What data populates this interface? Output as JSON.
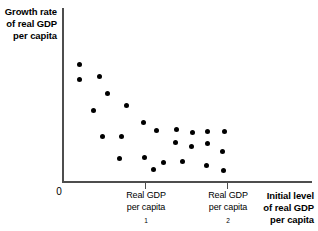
{
  "chart_data": {
    "type": "scatter",
    "title": "",
    "xlabel": "Initial level of real GDP per capita",
    "ylabel": "Growth rate of real GDP per capita",
    "grid": false,
    "legend": null,
    "xlim": [
      0,
      100
    ],
    "ylim": [
      0,
      100
    ],
    "axis_origin_label": "0",
    "xticks": [
      {
        "pos_px": 145,
        "value": 38,
        "label_line1": "Real GDP",
        "label_line2": "per capita",
        "label_sub": "1"
      },
      {
        "pos_px": 227,
        "value": 70,
        "label_line1": "Real GDP",
        "label_line2": "per capita",
        "label_sub": "2"
      }
    ],
    "points": [
      {
        "x_px": 79,
        "y_px": 64
      },
      {
        "x_px": 79,
        "y_px": 79
      },
      {
        "x_px": 99,
        "y_px": 76
      },
      {
        "x_px": 107,
        "y_px": 93
      },
      {
        "x_px": 93,
        "y_px": 110
      },
      {
        "x_px": 126,
        "y_px": 105
      },
      {
        "x_px": 102,
        "y_px": 136
      },
      {
        "x_px": 121,
        "y_px": 136
      },
      {
        "x_px": 143,
        "y_px": 122
      },
      {
        "x_px": 156,
        "y_px": 130
      },
      {
        "x_px": 176,
        "y_px": 129
      },
      {
        "x_px": 192,
        "y_px": 132
      },
      {
        "x_px": 207,
        "y_px": 131
      },
      {
        "x_px": 224,
        "y_px": 131
      },
      {
        "x_px": 175,
        "y_px": 142
      },
      {
        "x_px": 191,
        "y_px": 146
      },
      {
        "x_px": 207,
        "y_px": 143
      },
      {
        "x_px": 222,
        "y_px": 151
      },
      {
        "x_px": 119,
        "y_px": 158
      },
      {
        "x_px": 144,
        "y_px": 157
      },
      {
        "x_px": 163,
        "y_px": 162
      },
      {
        "x_px": 182,
        "y_px": 161
      },
      {
        "x_px": 153,
        "y_px": 169
      },
      {
        "x_px": 206,
        "y_px": 165
      },
      {
        "x_px": 223,
        "y_px": 170
      }
    ]
  },
  "axes": {
    "y_label_lines": [
      "Growth rate",
      "of real GDP",
      "per capita"
    ],
    "x_label_lines": [
      "Initial level",
      "of real GDP",
      "per capita"
    ],
    "origin": "0"
  },
  "colors": {
    "point": "#000000",
    "axis": "#4d4d4d",
    "background": "#ffffff",
    "text": "#000000"
  }
}
